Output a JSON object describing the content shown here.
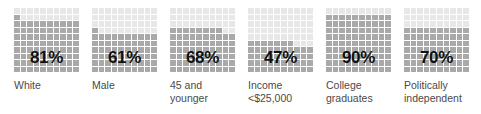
{
  "chart_data": {
    "type": "bar",
    "subtype": "waffle-grid",
    "title": "",
    "xlabel": "",
    "ylabel": "",
    "ylim": [
      0,
      100
    ],
    "grid": true,
    "legend": "none",
    "unit": "%",
    "grid_rows": 10,
    "grid_cols": 10,
    "fill_order": "bottom-up-left-to-right",
    "categories": [
      "White",
      "Male",
      "45 and younger",
      "Income <$25,000",
      "College graduates",
      "Politically independent"
    ],
    "values": [
      81,
      61,
      68,
      47,
      90,
      70
    ],
    "series": [
      {
        "name": "Percent",
        "values": [
          81,
          61,
          68,
          47,
          90,
          70
        ]
      }
    ]
  },
  "colors": {
    "filled": "#a9a9a9",
    "empty": "#e7e7e7",
    "value_text": "#111111",
    "label_text": "#4a4a4a",
    "background": "#ffffff"
  },
  "items": [
    {
      "value_label": "81%",
      "value": 81,
      "label": "White"
    },
    {
      "value_label": "61%",
      "value": 61,
      "label": "Male"
    },
    {
      "value_label": "68%",
      "value": 68,
      "label": "45 and\nyounger"
    },
    {
      "value_label": "47%",
      "value": 47,
      "label": "Income\n<$25,000"
    },
    {
      "value_label": "90%",
      "value": 90,
      "label": "College\ngraduates"
    },
    {
      "value_label": "70%",
      "value": 70,
      "label": "Politically\nindependent"
    }
  ]
}
